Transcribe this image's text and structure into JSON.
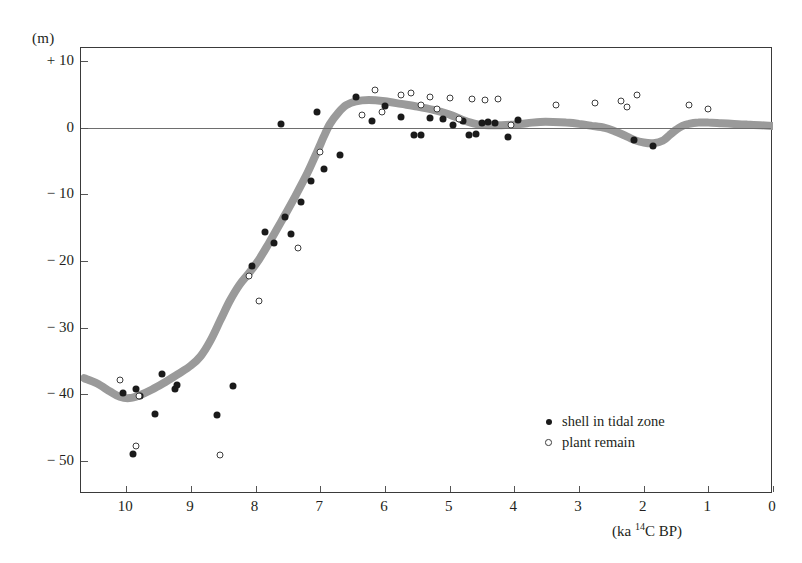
{
  "chart_data": {
    "type": "scatter",
    "title": "",
    "subtitle": "",
    "xlabel": "(ka 14C BP)",
    "ylabel": "(m)",
    "xlim": [
      10.7,
      0
    ],
    "ylim": [
      -55,
      12
    ],
    "x_axis_reversed": true,
    "grid": false,
    "zero_line": true,
    "legend_position": "bottom-right",
    "y_ticks": [
      {
        "value": 10,
        "label": "+ 10"
      },
      {
        "value": 0,
        "label": "0"
      },
      {
        "value": -10,
        "label": "− 10"
      },
      {
        "value": -20,
        "label": "− 20"
      },
      {
        "value": -30,
        "label": "− 30"
      },
      {
        "value": -40,
        "label": "− 40"
      },
      {
        "value": -50,
        "label": "− 50"
      }
    ],
    "x_ticks": [
      {
        "value": 10,
        "label": "10"
      },
      {
        "value": 9,
        "label": "9"
      },
      {
        "value": 8,
        "label": "8"
      },
      {
        "value": 7,
        "label": "7"
      },
      {
        "value": 6,
        "label": "6"
      },
      {
        "value": 5,
        "label": "5"
      },
      {
        "value": 4,
        "label": "4"
      },
      {
        "value": 3,
        "label": "3"
      },
      {
        "value": 2,
        "label": "2"
      },
      {
        "value": 1,
        "label": "1"
      },
      {
        "value": 0,
        "label": "0"
      }
    ],
    "legend": [
      {
        "name": "shell in tidal zone",
        "marker": "filled-circle",
        "color": "#1a1a1a"
      },
      {
        "name": "plant remain",
        "marker": "open-circle",
        "color": "#ffffff"
      }
    ],
    "series": [
      {
        "name": "shell in tidal zone",
        "marker": "filled-circle",
        "points": [
          [
            9.85,
            -39.3
          ],
          [
            9.45,
            -37.0
          ],
          [
            9.25,
            -39.2
          ],
          [
            9.22,
            -38.6
          ],
          [
            9.78,
            -40.3
          ],
          [
            10.05,
            -39.8
          ],
          [
            9.55,
            -43.0
          ],
          [
            9.9,
            -49.0
          ],
          [
            8.6,
            -43.2
          ],
          [
            8.35,
            -38.8
          ],
          [
            8.05,
            -20.8
          ],
          [
            7.85,
            -15.6
          ],
          [
            7.72,
            -17.3
          ],
          [
            7.55,
            -13.4
          ],
          [
            7.45,
            -16.0
          ],
          [
            7.3,
            -11.2
          ],
          [
            7.15,
            -8.0
          ],
          [
            6.95,
            -6.2
          ],
          [
            6.7,
            -4.1
          ],
          [
            7.05,
            2.4
          ],
          [
            7.6,
            0.6
          ],
          [
            6.45,
            4.6
          ],
          [
            6.2,
            1.1
          ],
          [
            6.0,
            3.3
          ],
          [
            5.75,
            1.6
          ],
          [
            5.55,
            -1.1
          ],
          [
            5.45,
            -1.0
          ],
          [
            5.3,
            1.5
          ],
          [
            5.1,
            1.3
          ],
          [
            4.95,
            0.5
          ],
          [
            4.8,
            1.1
          ],
          [
            4.7,
            -1.0
          ],
          [
            4.6,
            -0.9
          ],
          [
            4.5,
            0.8
          ],
          [
            4.4,
            0.9
          ],
          [
            4.3,
            0.7
          ],
          [
            4.1,
            -1.4
          ],
          [
            3.95,
            1.2
          ],
          [
            2.15,
            -1.8
          ],
          [
            1.85,
            -2.7
          ]
        ]
      },
      {
        "name": "plant remain",
        "marker": "open-circle",
        "points": [
          [
            10.1,
            -37.9
          ],
          [
            9.8,
            -40.3
          ],
          [
            9.85,
            -47.8
          ],
          [
            8.55,
            -49.2
          ],
          [
            8.1,
            -22.3
          ],
          [
            7.95,
            -26.0
          ],
          [
            7.35,
            -18.0
          ],
          [
            7.0,
            -3.6
          ],
          [
            6.35,
            2.0
          ],
          [
            6.15,
            5.7
          ],
          [
            6.05,
            2.4
          ],
          [
            5.75,
            4.9
          ],
          [
            5.6,
            5.2
          ],
          [
            5.45,
            3.4
          ],
          [
            5.3,
            4.7
          ],
          [
            5.2,
            2.9
          ],
          [
            5.0,
            4.5
          ],
          [
            4.85,
            1.3
          ],
          [
            4.65,
            4.4
          ],
          [
            4.45,
            4.2
          ],
          [
            4.25,
            4.3
          ],
          [
            4.05,
            0.4
          ],
          [
            3.35,
            3.5
          ],
          [
            2.75,
            3.8
          ],
          [
            2.35,
            4.0
          ],
          [
            2.25,
            3.2
          ],
          [
            2.1,
            5.0
          ],
          [
            1.3,
            3.4
          ],
          [
            1.0,
            2.8
          ]
        ]
      }
    ],
    "curve": {
      "name": "sea-level curve",
      "style": "thick-grey-band",
      "color": "#9a9a9a",
      "width_px": 8,
      "points": [
        [
          10.65,
          -37.6
        ],
        [
          10.45,
          -38.4
        ],
        [
          10.25,
          -39.6
        ],
        [
          10.1,
          -40.4
        ],
        [
          9.95,
          -40.6
        ],
        [
          9.8,
          -40.2
        ],
        [
          9.6,
          -39.3
        ],
        [
          9.4,
          -38.2
        ],
        [
          9.2,
          -37.0
        ],
        [
          9.0,
          -35.7
        ],
        [
          8.85,
          -34.3
        ],
        [
          8.7,
          -32.0
        ],
        [
          8.55,
          -29.0
        ],
        [
          8.4,
          -26.0
        ],
        [
          8.25,
          -23.6
        ],
        [
          8.1,
          -21.8
        ],
        [
          7.95,
          -19.8
        ],
        [
          7.8,
          -17.4
        ],
        [
          7.6,
          -14.0
        ],
        [
          7.4,
          -10.5
        ],
        [
          7.2,
          -6.8
        ],
        [
          7.05,
          -3.6
        ],
        [
          6.95,
          -1.4
        ],
        [
          6.85,
          0.6
        ],
        [
          6.72,
          2.3
        ],
        [
          6.6,
          3.4
        ],
        [
          6.45,
          4.0
        ],
        [
          6.25,
          4.2
        ],
        [
          6.0,
          4.0
        ],
        [
          5.75,
          3.6
        ],
        [
          5.5,
          3.2
        ],
        [
          5.25,
          2.7
        ],
        [
          5.0,
          2.0
        ],
        [
          4.8,
          1.2
        ],
        [
          4.6,
          0.6
        ],
        [
          4.4,
          0.4
        ],
        [
          4.2,
          0.4
        ],
        [
          4.0,
          0.5
        ],
        [
          3.8,
          0.7
        ],
        [
          3.6,
          0.9
        ],
        [
          3.4,
          0.9
        ],
        [
          3.2,
          0.8
        ],
        [
          3.0,
          0.6
        ],
        [
          2.8,
          0.3
        ],
        [
          2.6,
          0.0
        ],
        [
          2.45,
          -0.5
        ],
        [
          2.3,
          -1.1
        ],
        [
          2.15,
          -1.8
        ],
        [
          2.0,
          -2.2
        ],
        [
          1.85,
          -2.3
        ],
        [
          1.7,
          -1.9
        ],
        [
          1.6,
          -1.1
        ],
        [
          1.5,
          -0.3
        ],
        [
          1.4,
          0.3
        ],
        [
          1.3,
          0.6
        ],
        [
          1.15,
          0.8
        ],
        [
          1.0,
          0.8
        ],
        [
          0.8,
          0.7
        ],
        [
          0.6,
          0.6
        ],
        [
          0.4,
          0.5
        ],
        [
          0.2,
          0.4
        ],
        [
          0.0,
          0.3
        ]
      ]
    }
  }
}
